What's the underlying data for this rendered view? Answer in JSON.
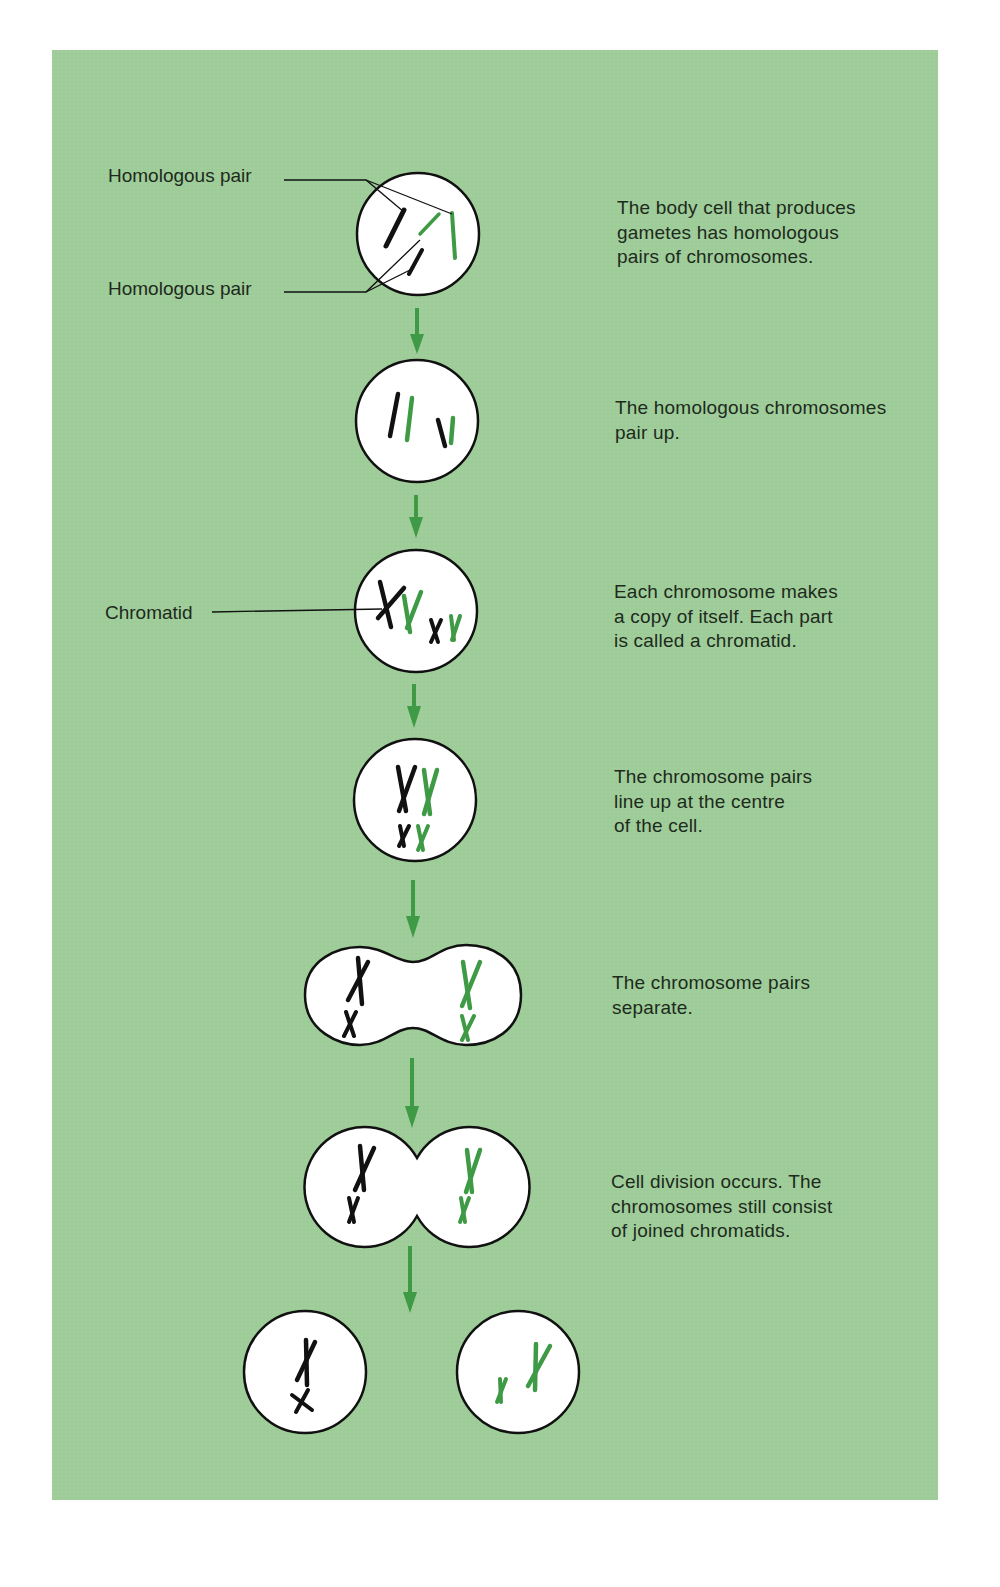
{
  "figure": {
    "title": "",
    "colors": {
      "background": "#9dcc98",
      "cell_fill": "#ffffff",
      "cell_outline": "#111111",
      "chromosome_dark": "#111111",
      "chromosome_green": "#3f9a45",
      "arrow": "#3f9a45"
    },
    "callouts": {
      "homologous_pair_top": "Homologous pair",
      "homologous_pair_bottom": "Homologous pair",
      "chromatid": "Chromatid"
    },
    "steps": [
      {
        "id": 1,
        "shape": "circle",
        "description": "The body cell that produces\ngametes has homologous\npairs of chromosomes."
      },
      {
        "id": 2,
        "shape": "circle",
        "description": "The homologous chromosomes\npair up."
      },
      {
        "id": 3,
        "shape": "circle",
        "description": "Each chromosome makes\na copy of itself. Each part\nis called a chromatid."
      },
      {
        "id": 4,
        "shape": "circle",
        "description": "The chromosome pairs\nline up at the centre\nof the cell."
      },
      {
        "id": 5,
        "shape": "pinched-oval",
        "description": "The chromosome pairs\nseparate."
      },
      {
        "id": 6,
        "shape": "two-joined-circles",
        "description": "Cell division occurs. The\nchromosomes still consist\nof joined chromatids."
      },
      {
        "id": 7,
        "shape": "two-separate-circles",
        "description": ""
      }
    ],
    "arrow_count": 6
  }
}
